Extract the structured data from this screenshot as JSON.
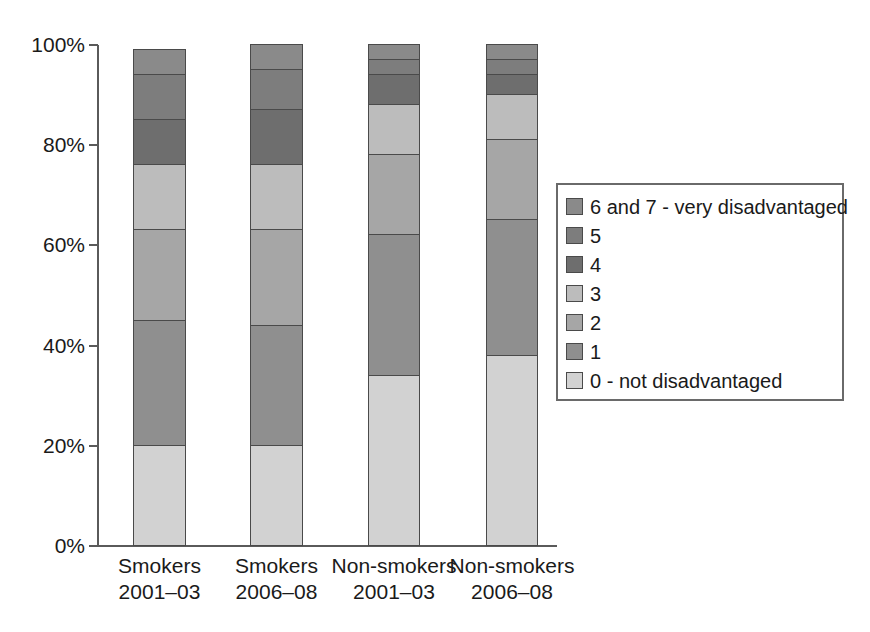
{
  "chart_data": {
    "type": "bar",
    "subtype": "stacked-percentage",
    "title": "",
    "xlabel": "",
    "ylabel": "",
    "ylim": [
      0,
      100
    ],
    "ytick_labels": [
      "0%",
      "20%",
      "40%",
      "60%",
      "80%",
      "100%"
    ],
    "ytick_values": [
      0,
      20,
      40,
      60,
      80,
      100
    ],
    "grid": false,
    "legend_position": "right",
    "categories": [
      "Smokers 2001–03",
      "Smokers 2006–08",
      "Non-smokers 2001–03",
      "Non-smokers 2006–08"
    ],
    "category_lines": [
      [
        "Smokers",
        "2001–03"
      ],
      [
        "Smokers",
        "2006–08"
      ],
      [
        "Non-smokers",
        "2001–03"
      ],
      [
        "Non-smokers",
        "2006–08"
      ]
    ],
    "series": [
      {
        "name": "0 - not disadvantaged",
        "color": "#d2d2d2",
        "values": [
          20,
          20,
          34,
          38
        ]
      },
      {
        "name": "1",
        "color": "#8f8f8f",
        "values": [
          25,
          24,
          28,
          27
        ]
      },
      {
        "name": "2",
        "color": "#a6a6a6",
        "values": [
          18,
          19,
          16,
          16
        ]
      },
      {
        "name": "3",
        "color": "#bcbcbc",
        "values": [
          13,
          13,
          10,
          9
        ]
      },
      {
        "name": "4",
        "color": "#6e6e6e",
        "values": [
          9,
          11,
          6,
          4
        ]
      },
      {
        "name": "5",
        "color": "#7d7d7d",
        "values": [
          9,
          8,
          3,
          3
        ]
      },
      {
        "name": "6 and 7 - very disadvantaged",
        "color": "#8a8a8a",
        "values": [
          5,
          5,
          3,
          3
        ]
      }
    ],
    "cumulative_tops": [
      [
        20,
        45,
        63,
        76,
        85,
        94,
        100
      ],
      [
        20,
        44,
        63,
        76,
        87,
        95,
        100
      ],
      [
        34,
        62,
        78,
        88,
        94,
        97,
        100
      ],
      [
        38,
        65,
        81,
        90,
        94,
        97,
        100
      ]
    ]
  },
  "legend": {
    "items": [
      {
        "label": "6 and 7 - very disadvantaged",
        "color": "#8a8a8a"
      },
      {
        "label": "5",
        "color": "#7d7d7d"
      },
      {
        "label": "4",
        "color": "#6e6e6e"
      },
      {
        "label": "3",
        "color": "#bcbcbc"
      },
      {
        "label": "2",
        "color": "#a6a6a6"
      },
      {
        "label": "1",
        "color": "#8f8f8f"
      },
      {
        "label": "0 - not disadvantaged",
        "color": "#d2d2d2"
      }
    ]
  },
  "axes": {
    "y_labels": [
      "100%",
      "80%",
      "60%",
      "40%",
      "20%",
      "0%"
    ]
  }
}
